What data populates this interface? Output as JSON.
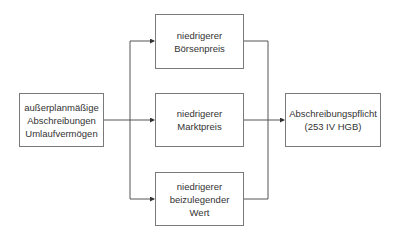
{
  "diagram": {
    "source": {
      "lines": [
        "außerplanmäßige",
        "Abschreibungen",
        "Umlaufvermögen"
      ]
    },
    "options": [
      {
        "lines": [
          "niedrigerer",
          "Börsenpreis"
        ]
      },
      {
        "lines": [
          "niedrigerer",
          "Marktpreis"
        ]
      },
      {
        "lines": [
          "niedrigerer",
          "beizulegender",
          "Wert"
        ]
      }
    ],
    "target": {
      "lines": [
        "Abschreibungspflicht",
        "(253 IV HGB)"
      ]
    },
    "colors": {
      "line": "#555555",
      "border": "#7a7a7a",
      "text": "#333333"
    }
  }
}
